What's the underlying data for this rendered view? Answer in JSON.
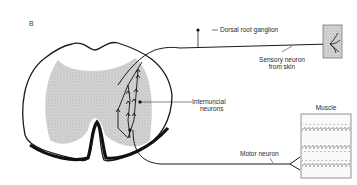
{
  "figure": {
    "panel_label": "B",
    "labels": {
      "dorsal_root_ganglion": "Dorsal root ganglion",
      "sensory_neuron_line1": "Sensory neuron",
      "sensory_neuron_line2": "from skin",
      "internuncial_line1": "Internuncial",
      "internuncial_line2": "neurons",
      "muscle": "Muscle",
      "motor_neuron": "Motor neuron"
    },
    "colors": {
      "ink": "#1a1a1a",
      "gray_matter": "#c8c8c8",
      "skin_patch": "#d4d4d4"
    }
  }
}
